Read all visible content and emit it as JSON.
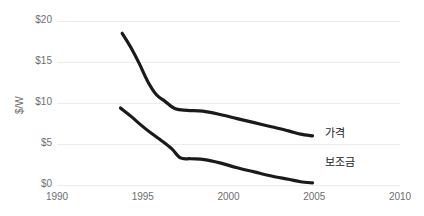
{
  "chart_data": {
    "type": "line",
    "title": "",
    "subtitle": "",
    "xlabel": "",
    "ylabel": "$/W",
    "xlim": [
      1990,
      2010
    ],
    "ylim": [
      0,
      20
    ],
    "grid": true,
    "grid_axis": "y",
    "legend_position": "inline-right",
    "x_ticks": [
      "1990",
      "1995",
      "2000",
      "2005",
      "2010"
    ],
    "x_tick_values": [
      1990,
      1995,
      2000,
      2005,
      2010
    ],
    "y_ticks": [
      "$0",
      "$5",
      "$10",
      "$15",
      "$20"
    ],
    "y_tick_values": [
      0,
      5,
      10,
      15,
      20
    ],
    "series": [
      {
        "name": "가격",
        "color": "#1a1a1a",
        "label_x": 2005.6,
        "label_y": 6.6,
        "x": [
          1993.8,
          1994.3,
          1994.8,
          1995.3,
          1995.8,
          1996.3,
          1996.9,
          1997.6,
          1998.5,
          1999.5,
          2000.5,
          2001.5,
          2002.5,
          2003.5,
          2004.2,
          2004.9
        ],
        "values": [
          18.5,
          16.8,
          14.8,
          12.6,
          11.0,
          10.2,
          9.3,
          9.1,
          9.0,
          8.6,
          8.1,
          7.6,
          7.1,
          6.6,
          6.2,
          6.0
        ]
      },
      {
        "name": "보조금",
        "color": "#1a1a1a",
        "label_x": 2005.6,
        "label_y": 3.1,
        "x": [
          1993.7,
          1994.3,
          1994.9,
          1995.5,
          1996.1,
          1996.7,
          1997.2,
          1997.8,
          1998.6,
          1999.5,
          2000.5,
          2001.5,
          2002.5,
          2003.5,
          2004.2,
          2004.9
        ],
        "values": [
          9.4,
          8.4,
          7.3,
          6.3,
          5.4,
          4.4,
          3.3,
          3.2,
          3.1,
          2.7,
          2.1,
          1.6,
          1.1,
          0.7,
          0.4,
          0.25
        ]
      }
    ]
  },
  "plot": {
    "left_px": 57,
    "right_px": 400,
    "top_px": 21,
    "bottom_px": 185,
    "x_min": 1990,
    "x_max": 2010,
    "y_min": 0,
    "y_max": 20,
    "gridline_color": "#ebebeb",
    "background": "#ffffff",
    "line_width": 3.2
  }
}
